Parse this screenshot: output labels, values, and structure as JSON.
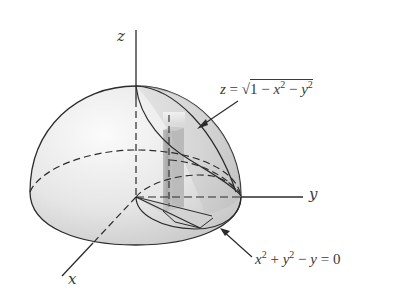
{
  "figure": {
    "axes": {
      "z_label": "z",
      "y_label": "y",
      "x_label": "x"
    },
    "annotations": {
      "surface": {
        "lhs": "z",
        "equals": "=",
        "sqrt_symbol": "√",
        "radicand_parts": [
          "1",
          "−",
          "x",
          "2",
          "−",
          "y",
          "2"
        ],
        "full_text": "z = √(1 − x² − y²)"
      },
      "cylinder": {
        "parts": [
          "x",
          "2",
          "+",
          "y",
          "2",
          "−",
          "y",
          "=",
          "0"
        ],
        "full_text": "x² + y² − y = 0"
      }
    },
    "colors": {
      "line": "#2b2b2b",
      "surface_fill_light": "#f2f2f2",
      "surface_fill_dark": "#c8c8c8",
      "column_fill": "#a9a9a9",
      "text": "#3a3a3a"
    }
  }
}
